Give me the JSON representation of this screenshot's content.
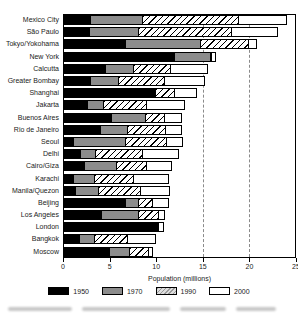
{
  "chart_data": {
    "type": "bar",
    "orientation": "horizontal",
    "title": "",
    "xlabel": "Population (millions)",
    "xlim": [
      0,
      25
    ],
    "xticks": [
      0,
      5,
      10,
      15,
      20,
      25
    ],
    "gridlines_at": [
      15,
      20
    ],
    "grid_style": "dashed-vertical",
    "legend_position": "bottom",
    "categories": [
      "Mexico City",
      "São Paulo",
      "Tokyo/Yokohama",
      "New York",
      "Calcutta",
      "Greater Bombay",
      "Shanghai",
      "Jakarta",
      "Buenos Aires",
      "Rio de Janeiro",
      "Seoul",
      "Delhi",
      "Cairo/Giza",
      "Karachi",
      "Manila/Quezon",
      "Beijing",
      "Los Angeles",
      "London",
      "Bangkok",
      "Moscow"
    ],
    "series_note": "Layered bars: each year's segment extends to that year's population value",
    "series": [
      {
        "name": "1950",
        "style": "solid-black",
        "color": "#000000",
        "values": [
          2.9,
          2.8,
          6.7,
          11.9,
          4.5,
          2.9,
          9.9,
          2.6,
          5.1,
          4.0,
          1.1,
          1.8,
          2.2,
          1.1,
          1.3,
          6.7,
          4.1,
          10.2,
          1.7,
          4.9
        ]
      },
      {
        "name": "1970",
        "style": "solid-gray",
        "color": "#8c8c8c",
        "values": [
          8.5,
          8.1,
          14.7,
          15.8,
          7.5,
          5.9,
          9.9,
          4.3,
          8.8,
          6.9,
          6.7,
          3.4,
          5.7,
          3.3,
          3.8,
          8.0,
          8.0,
          10.2,
          3.3,
          7.1
        ]
      },
      {
        "name": "1990",
        "style": "diagonal-hatch",
        "color": "#c8c8c8",
        "values": [
          18.8,
          18.0,
          19.8,
          15.9,
          11.5,
          10.8,
          11.9,
          8.9,
          10.8,
          10.9,
          11.1,
          8.5,
          8.9,
          7.5,
          8.3,
          9.6,
          10.2,
          10.2,
          6.9,
          9.1
        ]
      },
      {
        "name": "2000",
        "style": "white",
        "color": "#ffffff",
        "values": [
          23.8,
          22.9,
          20.6,
          16.2,
          15.3,
          15.0,
          14.2,
          12.9,
          12.6,
          12.6,
          12.7,
          12.2,
          11.5,
          11.2,
          11.3,
          11.2,
          10.7,
          10.6,
          9.8,
          9.4
        ]
      }
    ]
  }
}
